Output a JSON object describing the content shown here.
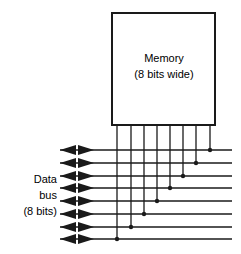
{
  "diagram": {
    "type": "block-diagram",
    "background_color": "#ffffff",
    "line_color": "#1a1a1a",
    "text_color": "#000000"
  },
  "memory_block": {
    "label_line1": "Memory",
    "label_line2": "(8 bits wide)",
    "x": 112,
    "y": 13,
    "width": 103,
    "height": 112,
    "stroke_width": 2,
    "fill": "#ffffff",
    "label1_x": 164,
    "label1_y": 62,
    "label2_x": 164,
    "label2_y": 78
  },
  "bus_label": {
    "line1": "Data",
    "line2": "bus",
    "line3": "(8 bits)",
    "x": 57,
    "line1_y": 183,
    "line2_y": 199,
    "line3_y": 215
  },
  "bus_lines": {
    "count": 8,
    "x_start": 60,
    "x_end": 232,
    "stroke_width": 1.3,
    "y_values": [
      150,
      163,
      176,
      188,
      201,
      214,
      227,
      239
    ],
    "arrow_left_tip_x": 60,
    "arrow_left_tail_x": 76,
    "arrow_right_tip_x": 94,
    "arrow_right_tail_x": 78,
    "arrow_half_height": 5
  },
  "drop_lines": {
    "count": 8,
    "y_top": 125,
    "stroke_width": 1.3,
    "dot_radius": 2.2,
    "lines": [
      {
        "bit": 0,
        "x": 117,
        "connects_to_bus_index": 7,
        "y_end": 239
      },
      {
        "bit": 1,
        "x": 131,
        "connects_to_bus_index": 6,
        "y_end": 227
      },
      {
        "bit": 2,
        "x": 144,
        "connects_to_bus_index": 5,
        "y_end": 214
      },
      {
        "bit": 3,
        "x": 157,
        "connects_to_bus_index": 4,
        "y_end": 201
      },
      {
        "bit": 4,
        "x": 170,
        "connects_to_bus_index": 3,
        "y_end": 188
      },
      {
        "bit": 5,
        "x": 183,
        "connects_to_bus_index": 2,
        "y_end": 176
      },
      {
        "bit": 6,
        "x": 196,
        "connects_to_bus_index": 1,
        "y_end": 163
      },
      {
        "bit": 7,
        "x": 210,
        "connects_to_bus_index": 0,
        "y_end": 150
      }
    ]
  }
}
